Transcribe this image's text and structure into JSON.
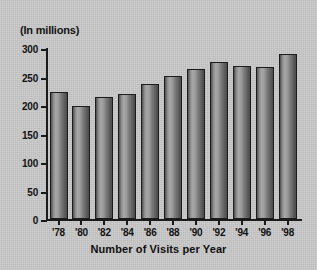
{
  "chart_data": {
    "type": "bar",
    "title": "(In millions)",
    "xlabel": "Number of Visits per Year",
    "ylabel": "",
    "categories": [
      "'78",
      "'80",
      "'82",
      "'84",
      "'86",
      "'88",
      "'90",
      "'92",
      "'94",
      "'96",
      "'98"
    ],
    "values": [
      222,
      198,
      214,
      219,
      237,
      251,
      264,
      276,
      268,
      266,
      289
    ],
    "ylim": [
      0,
      300
    ],
    "yticks": [
      0,
      50,
      100,
      150,
      200,
      250,
      300
    ],
    "ytick_labels": [
      "0",
      "50",
      "100",
      "150",
      "200",
      "250",
      "300"
    ],
    "grid": false,
    "legend": false,
    "bar_color": "#8e8e8e",
    "bar_edge_color": "#1c1c1c",
    "background_color": "#c9c9c9",
    "axis_color": "#1a1a1a"
  }
}
